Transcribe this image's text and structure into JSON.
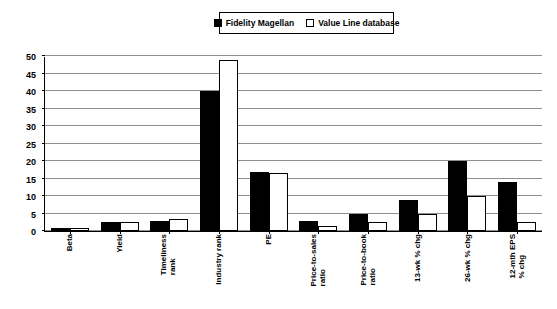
{
  "legend": {
    "position": "top-center",
    "entries": [
      {
        "label": "Fidelity Magellan",
        "swatch": "filled-square-icon",
        "color": "#000000"
      },
      {
        "label": "Value Line database",
        "swatch": "hollow-square-icon",
        "color": "#ffffff"
      }
    ]
  },
  "axis": {
    "y_ticks": [
      "0",
      "5",
      "10",
      "15",
      "20",
      "25",
      "30",
      "35",
      "40",
      "45",
      "50"
    ]
  },
  "chart_data": {
    "type": "bar",
    "title": "",
    "subtitle": "",
    "xlabel": "",
    "ylabel": "",
    "ylim": [
      0,
      50
    ],
    "ytick_step": 5,
    "grid": true,
    "legend_position": "top-center",
    "categories": [
      "Beta",
      "Yield",
      "Timeliness rank",
      "Industry rank",
      "PE",
      "Price-to-sales ratio",
      "Price-to-book ratio",
      "13-wk % chg",
      "26-wk % chg",
      "12-mth EPS % chg"
    ],
    "category_lines": [
      [
        "Beta"
      ],
      [
        "Yield"
      ],
      [
        "Timeliness",
        "rank"
      ],
      [
        "Industry rank"
      ],
      [
        "PE"
      ],
      [
        "Price-to-sales",
        "ratio"
      ],
      [
        "Price-to-book",
        "ratio"
      ],
      [
        "13-wk % chg"
      ],
      [
        "26-wk % chg"
      ],
      [
        "12-mth EPS",
        "% chg"
      ]
    ],
    "series": [
      {
        "name": "Fidelity Magellan",
        "color": "#000000",
        "values": [
          1,
          2.5,
          3,
          40,
          17,
          3,
          5,
          9,
          20,
          14
        ]
      },
      {
        "name": "Value Line database",
        "color": "#ffffff",
        "values": [
          1,
          2.5,
          3.5,
          49,
          16.5,
          1.5,
          2.5,
          5,
          10,
          2.5
        ]
      }
    ]
  }
}
